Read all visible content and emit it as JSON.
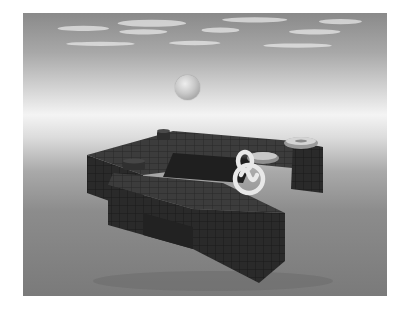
{
  "scene": {
    "description": "Grayscale 3D render of a floating block maze structure above a foggy ground plane under a cloudy sky",
    "colors": {
      "sky_top": "#8a8a8a",
      "horizon": "#f4f4f4",
      "ground": "#7a7a7a",
      "block_top": "#3a3a3a",
      "block_side": "#262626",
      "ring": "#e6e6e6"
    },
    "objects": [
      {
        "type": "sphere",
        "label": "floating-ball"
      },
      {
        "type": "maze-platform",
        "label": "block-structure"
      },
      {
        "type": "torus",
        "label": "ring-pickup"
      },
      {
        "type": "torus",
        "label": "ring-pickup"
      },
      {
        "type": "knot",
        "label": "trefoil-knot"
      },
      {
        "type": "cylinder",
        "label": "small-post"
      },
      {
        "type": "cylinder",
        "label": "small-post"
      }
    ]
  }
}
